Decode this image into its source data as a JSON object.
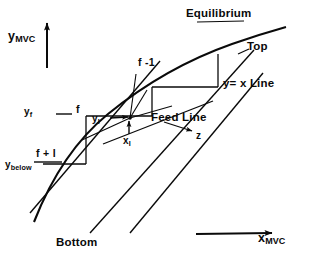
{
  "figure": {
    "type": "mccabe-thiele-diagram",
    "axes": {
      "y": {
        "label_main": "y",
        "label_sub": "MVC",
        "arrow": "up-arrow-icon"
      },
      "x": {
        "label_main": "x",
        "label_sub": "MVC",
        "arrow": "right-arrow-icon"
      }
    },
    "curves": {
      "equilibrium": {
        "label": "Equilibrium"
      },
      "top_operating": {
        "label": "Top"
      },
      "bottom_operating": {
        "label": "Bottom"
      },
      "diagonal": {
        "label": "y= x  Line"
      },
      "feed": {
        "label": "Feed Line"
      }
    },
    "stages": [
      {
        "label": "f -1"
      },
      {
        "label": "f"
      },
      {
        "label": "f + l"
      }
    ],
    "points": {
      "y_f": {
        "main": "y",
        "sub": "f"
      },
      "y_below": {
        "main": "y",
        "sub": "below"
      },
      "y_I": {
        "main": "y",
        "sub": "I"
      },
      "x_I": {
        "main": "x",
        "sub": "I"
      },
      "z": {
        "label": "z"
      }
    },
    "colors": {
      "ink": "#0a0a0a",
      "background": "#ffffff"
    }
  }
}
